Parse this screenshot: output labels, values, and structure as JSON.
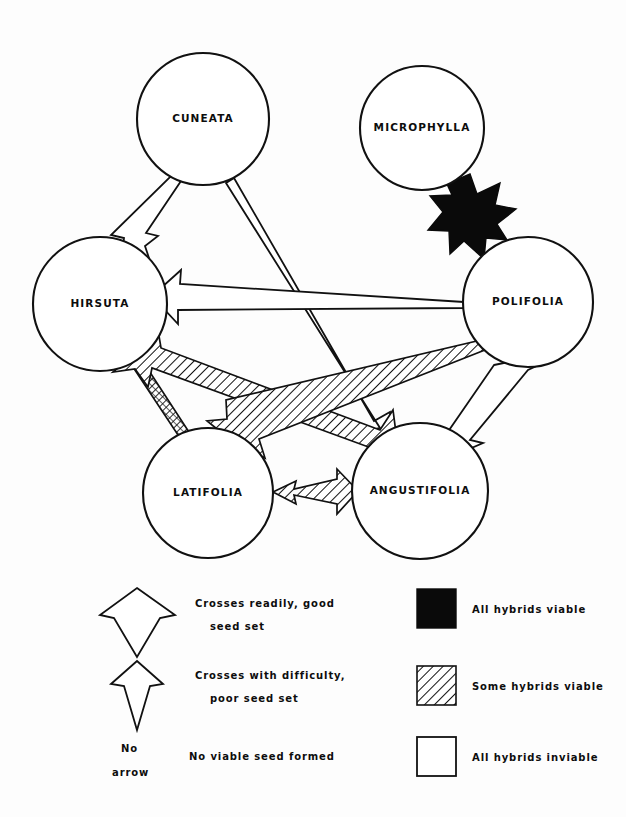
{
  "figure": {
    "background_color": "#ffffff",
    "ink_color": "#111111"
  },
  "nodes": [
    {
      "id": "cuneata",
      "label": "CUNEATA",
      "cx": 203,
      "cy": 119,
      "r": 66
    },
    {
      "id": "microphylla",
      "label": "MICROPHYLLA",
      "cx": 422,
      "cy": 128,
      "r": 62
    },
    {
      "id": "hirsuta",
      "label": "HIRSUTA",
      "cx": 100,
      "cy": 304,
      "r": 67
    },
    {
      "id": "polifolia",
      "label": "POLIFOLIA",
      "cx": 528,
      "cy": 302,
      "r": 65
    },
    {
      "id": "latifolia",
      "label": "LATIFOLIA",
      "cx": 208,
      "cy": 493,
      "r": 65
    },
    {
      "id": "angustifolia",
      "label": "ANGUSTIFOLIA",
      "cx": 420,
      "cy": 491,
      "r": 68
    }
  ],
  "edges": [
    {
      "id": "cuneata-hirsuta",
      "from": "cuneata",
      "to": "hirsuta",
      "cross": "Crosses with difficulty, poor seed set",
      "viability": "All hybrids inviable",
      "heads": 1,
      "style": "open-narrow"
    },
    {
      "id": "microphylla-polifolia",
      "from": "microphylla",
      "to": "polifolia",
      "cross": "Crosses readily, good seed set",
      "viability": "All hybrids viable",
      "heads": 2,
      "style": "solid-wide"
    },
    {
      "id": "polifolia-hirsuta",
      "from": "polifolia",
      "to": "hirsuta",
      "cross": "Crosses readily, good seed set",
      "viability": "All hybrids inviable",
      "heads": 1,
      "style": "open-wide"
    },
    {
      "id": "hirsuta-latifolia",
      "from": "hirsuta",
      "to": "latifolia",
      "cross": "Crosses with difficulty, poor seed set",
      "viability": "Some hybrids viable",
      "heads": 2,
      "style": "hatch-narrow"
    },
    {
      "id": "hirsuta-angustifolia",
      "from": "hirsuta",
      "to": "angustifolia",
      "cross": "Crosses readily, good seed set",
      "viability": "Some hybrids viable",
      "heads": 2,
      "style": "hatch-wide"
    },
    {
      "id": "polifolia-latifolia",
      "from": "polifolia",
      "to": "latifolia",
      "cross": "Crosses readily, good seed set",
      "viability": "Some hybrids viable",
      "heads": 2,
      "style": "hatch-wide"
    },
    {
      "id": "polifolia-angustifolia",
      "from": "polifolia",
      "to": "angustifolia",
      "cross": "Crosses with difficulty, poor seed set",
      "viability": "All hybrids inviable",
      "heads": 2,
      "style": "open-narrow"
    },
    {
      "id": "latifolia-angustifolia",
      "from": "latifolia",
      "to": "angustifolia",
      "cross": "Crosses with difficulty, poor seed set",
      "viability": "Some hybrids viable",
      "heads": 2,
      "style": "hatch-narrow"
    },
    {
      "id": "cuneata-angustifolia",
      "from": "cuneata",
      "to": "angustifolia",
      "cross": "Crosses with difficulty, poor seed set",
      "viability": "All hybrids inviable",
      "heads": 1,
      "style": "open-narrow"
    }
  ],
  "legend": {
    "arrow_items": [
      {
        "id": "wide-arrow",
        "icon": "wide-open-arrow-icon",
        "line1": "Crosses  readily,  good",
        "line2": "seed  set"
      },
      {
        "id": "narrow-arrow",
        "icon": "narrow-open-arrow-icon",
        "line1": "Crosses   with   difficulty,",
        "line2": "poor  seed  set"
      },
      {
        "id": "no-arrow",
        "icon": "no-arrow-icon",
        "line1": "No",
        "line2": "arrow",
        "description": "No viable  seed  formed"
      }
    ],
    "swatch_items": [
      {
        "id": "all-viable",
        "icon": "black-square-icon",
        "label": "All hybrids  viable",
        "fill": "#0a0a0a"
      },
      {
        "id": "some-viable",
        "icon": "hatched-square-icon",
        "label": "Some  hybrids   viable",
        "fill": "hatched"
      },
      {
        "id": "all-inviable",
        "icon": "white-square-icon",
        "label": "All  hybrids   inviable",
        "fill": "#ffffff"
      }
    ]
  }
}
